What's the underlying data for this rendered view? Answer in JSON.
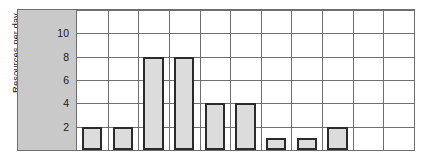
{
  "chart_data": {
    "type": "bar",
    "title": "",
    "xlabel": "",
    "ylabel": "Resources per day",
    "ylim": [
      0,
      12
    ],
    "yticks": [
      2,
      4,
      6,
      8,
      10
    ],
    "ytick_labels": [
      "2",
      "4",
      "6",
      "8",
      "10"
    ],
    "grid": true,
    "legend": null,
    "n_columns": 11,
    "categories": [
      "1",
      "2",
      "3",
      "4",
      "5",
      "6",
      "7",
      "8",
      "9",
      "10",
      "11"
    ],
    "values": [
      2,
      2,
      8,
      8,
      4,
      4,
      1,
      1,
      2,
      0,
      0
    ],
    "bars": [
      {
        "index": 0,
        "value": 2
      },
      {
        "index": 1,
        "value": 2
      },
      {
        "index": 2,
        "value": 8
      },
      {
        "index": 3,
        "value": 8
      },
      {
        "index": 4,
        "value": 4
      },
      {
        "index": 5,
        "value": 4
      },
      {
        "index": 6,
        "value": 1
      },
      {
        "index": 7,
        "value": 1
      },
      {
        "index": 8,
        "value": 2
      },
      {
        "index": 9,
        "value": 0
      },
      {
        "index": 10,
        "value": 0
      }
    ],
    "colors": {
      "bar_fill": "#dcdcdc",
      "bar_border": "#2b2b2b",
      "grid_line": "#6e6e6e",
      "scale_panel": "#c9c9c9",
      "plot_background": "#ffffff",
      "text": "#1a1a1a"
    }
  }
}
